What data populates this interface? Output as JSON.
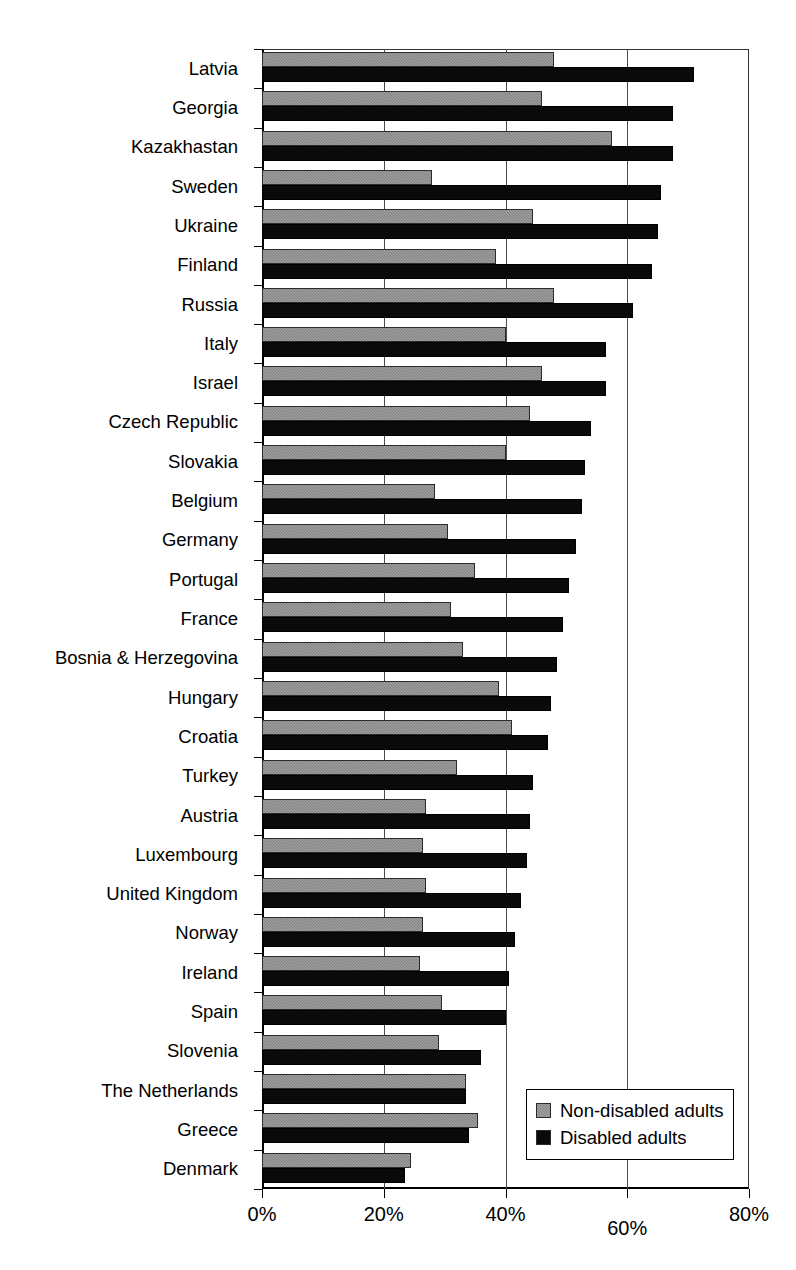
{
  "chart_data": {
    "type": "bar",
    "orientation": "horizontal",
    "title": "",
    "subtitle": "",
    "xlabel": "",
    "ylabel": "",
    "xlim": [
      0,
      80
    ],
    "xunit": "%",
    "grid": true,
    "legend_position": "bottom-right",
    "xticks": [
      {
        "value": 0,
        "label": "0%"
      },
      {
        "value": 20,
        "label": "20%"
      },
      {
        "value": 40,
        "label": "40%"
      },
      {
        "value": 60,
        "label": "60%"
      },
      {
        "value": 80,
        "label": "80%"
      }
    ],
    "categories": [
      "Latvia",
      "Georgia",
      "Kazakhastan",
      "Sweden",
      "Ukraine",
      "Finland",
      "Russia",
      "Italy",
      "Israel",
      "Czech Republic",
      "Slovakia",
      "Belgium",
      "Germany",
      "Portugal",
      "France",
      "Bosnia & Herzegovina",
      "Hungary",
      "Croatia",
      "Turkey",
      "Austria",
      "Luxembourg",
      "United Kingdom",
      "Norway",
      "Ireland",
      "Spain",
      "Slovenia",
      "The Netherlands",
      "Greece",
      "Denmark"
    ],
    "series": [
      {
        "name": "Non-disabled adults",
        "color": "#808080",
        "values": [
          48,
          46,
          57.5,
          28,
          44.5,
          38.5,
          48,
          40,
          46,
          44,
          40,
          28.5,
          30.5,
          35,
          31,
          33,
          39,
          41,
          32,
          27,
          26.5,
          27,
          26.5,
          26,
          29.5,
          29,
          33.5,
          35.5,
          24.5
        ]
      },
      {
        "name": "Disabled adults",
        "color": "#0a0a0a",
        "values": [
          71,
          67.5,
          67.5,
          65.5,
          65,
          64,
          61,
          56.5,
          56.5,
          54,
          53,
          52.5,
          51.5,
          50.5,
          49.5,
          48.5,
          47.5,
          47,
          44.5,
          44,
          43.5,
          42.5,
          41.5,
          40.5,
          40,
          36,
          33.5,
          34,
          23.5
        ]
      }
    ],
    "legend": [
      {
        "label": "Non-disabled adults",
        "swatch": "nondisabled"
      },
      {
        "label": "Disabled adults",
        "swatch": "disabled"
      }
    ]
  }
}
